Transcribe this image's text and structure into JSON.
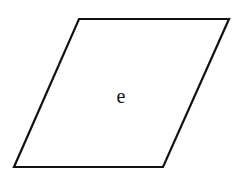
{
  "diagram": {
    "shape": "parallelogram",
    "label": "e",
    "stroke_color": "#111111",
    "fill_color": "#ffffff",
    "vertices": {
      "top_left": [
        79,
        19
      ],
      "top_right": [
        229,
        19
      ],
      "bottom_right": [
        163,
        167
      ],
      "bottom_left": [
        14,
        167
      ]
    }
  }
}
